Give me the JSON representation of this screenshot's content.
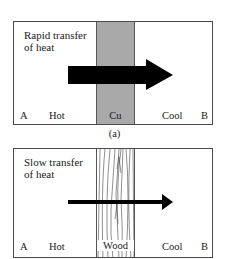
{
  "figure": {
    "panels": [
      {
        "id": "a",
        "title": "Rapid transfer\nof heat",
        "material": "Cu",
        "material_fill": "#a9a9a9",
        "arrow": "thick",
        "labels": {
          "left_end": "A",
          "left_side": "Hot",
          "right_side": "Cool",
          "right_end": "B"
        },
        "caption": "(a)"
      },
      {
        "id": "b",
        "title": "Slow transfer\nof heat",
        "material": "Wood",
        "material_fill": "#ffffff",
        "arrow": "thin",
        "labels": {
          "left_end": "A",
          "left_side": "Hot",
          "right_side": "Cool",
          "right_end": "B"
        }
      }
    ]
  },
  "colors": {
    "border": "#4a4a4a",
    "arrow": "#000000",
    "copper_strip": "#a9a9a9"
  }
}
